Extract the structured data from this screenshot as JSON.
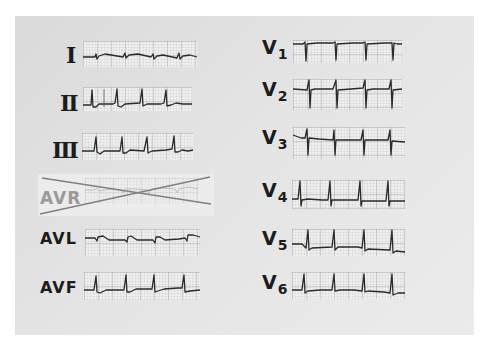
{
  "figure": {
    "limb_leads": [
      {
        "id": "I",
        "label": "I",
        "excluded": false
      },
      {
        "id": "II",
        "label": "II",
        "excluded": false
      },
      {
        "id": "III",
        "label": "III",
        "excluded": false
      },
      {
        "id": "AVR",
        "label": "AVR",
        "excluded": true,
        "exclusion_mark": "X (crossed out)"
      },
      {
        "id": "AVL",
        "label": "AVL",
        "excluded": false
      },
      {
        "id": "AVF",
        "label": "AVF",
        "excluded": false
      }
    ],
    "precordial_leads": [
      {
        "id": "V1",
        "letter": "V",
        "sub": "1"
      },
      {
        "id": "V2",
        "letter": "V",
        "sub": "2"
      },
      {
        "id": "V3",
        "letter": "V",
        "sub": "3"
      },
      {
        "id": "V4",
        "letter": "V",
        "sub": "4"
      },
      {
        "id": "V5",
        "letter": "V",
        "sub": "5"
      },
      {
        "id": "V6",
        "letter": "V",
        "sub": "6"
      }
    ],
    "colors": {
      "panel_background": "#e4e4e4",
      "grid_paper": "#efefef",
      "trace": "#2a2a2a",
      "label": "#1c1c1c",
      "excluded_label": "#9a9a9a",
      "cross_mark": "#808080"
    }
  }
}
